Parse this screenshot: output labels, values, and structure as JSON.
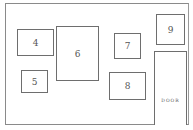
{
  "diagram": {
    "type": "wall-layout",
    "wall": {
      "x": 5,
      "y": 3,
      "width": 184,
      "height": 122
    },
    "frames": [
      {
        "id": "4",
        "label": "4",
        "x": 17,
        "y": 29,
        "width": 37,
        "height": 27
      },
      {
        "id": "5",
        "label": "5",
        "x": 21,
        "y": 70,
        "width": 27,
        "height": 23
      },
      {
        "id": "6",
        "label": "6",
        "x": 56,
        "y": 26,
        "width": 43,
        "height": 55
      },
      {
        "id": "7",
        "label": "7",
        "x": 114,
        "y": 33,
        "width": 27,
        "height": 26
      },
      {
        "id": "8",
        "label": "8",
        "x": 109,
        "y": 72,
        "width": 37,
        "height": 28
      },
      {
        "id": "9",
        "label": "9",
        "x": 156,
        "y": 14,
        "width": 29,
        "height": 31
      }
    ],
    "door": {
      "label": "DOOR",
      "x": 154,
      "y": 51,
      "width": 33,
      "height": 74
    },
    "colors": {
      "line": "#6e6e6e",
      "text": "#555555",
      "background": "#ffffff"
    }
  }
}
